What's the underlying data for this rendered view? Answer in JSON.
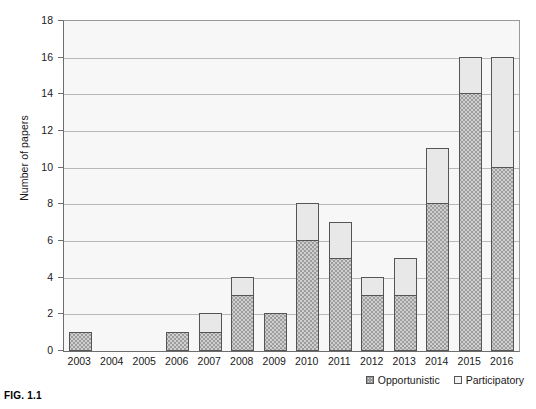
{
  "figure": {
    "caption": "FIG. 1.1"
  },
  "chart_data": {
    "type": "bar",
    "title": "",
    "subtitle": "",
    "xlabel": "",
    "ylabel": "Number of papers",
    "stacked": true,
    "grid": true,
    "legend_position": "bottom-right",
    "ylim": [
      0,
      18
    ],
    "ytick_step": 2,
    "yticks": [
      0,
      2,
      4,
      6,
      8,
      10,
      12,
      14,
      16,
      18
    ],
    "categories": [
      "2003",
      "2004",
      "2005",
      "2006",
      "2007",
      "2008",
      "2009",
      "2010",
      "2011",
      "2012",
      "2013",
      "2014",
      "2015",
      "2016"
    ],
    "series": [
      {
        "name": "Opportunistic",
        "color": "#9d9d9d",
        "values": [
          1,
          0,
          0,
          1,
          1,
          3,
          2,
          6,
          5,
          3,
          3,
          8,
          14,
          10
        ]
      },
      {
        "name": "Participatory",
        "color": "#e8e8e8",
        "values": [
          0,
          0,
          0,
          0,
          1,
          1,
          0,
          2,
          2,
          1,
          2,
          3,
          2,
          6
        ]
      }
    ],
    "totals": [
      1,
      0,
      0,
      1,
      2,
      4,
      2,
      8,
      7,
      4,
      5,
      11,
      16,
      16
    ]
  },
  "legend": {
    "items": [
      {
        "label": "Opportunistic",
        "swatch": "opportunistic"
      },
      {
        "label": "Participatory",
        "swatch": "participatory"
      }
    ]
  }
}
